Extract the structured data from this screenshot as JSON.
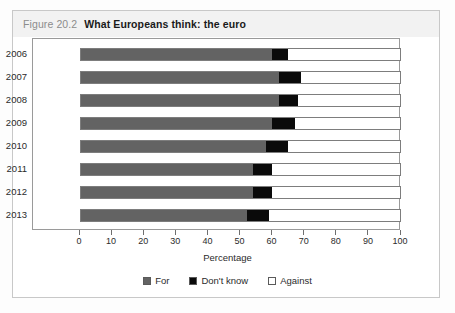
{
  "figure": {
    "number": "Figure 20.2",
    "title": "What Europeans think: the euro"
  },
  "legend": {
    "items": [
      {
        "label": "For",
        "color": "#636363",
        "swatch": "for-swatch"
      },
      {
        "label": "Don't know",
        "color": "#0a0a0a",
        "swatch": "dont-know-swatch"
      },
      {
        "label": "Against",
        "color": "#ffffff",
        "swatch": "against-swatch"
      }
    ]
  },
  "chart_data": {
    "type": "bar",
    "orientation": "horizontal",
    "stacked": true,
    "title": "What Europeans think: the euro",
    "xlabel": "Percentage",
    "ylabel": "",
    "xlim": [
      0,
      100
    ],
    "xticks": [
      0,
      10,
      20,
      30,
      40,
      50,
      60,
      70,
      80,
      90,
      100
    ],
    "grid": false,
    "legend_position": "bottom",
    "categories": [
      "2006",
      "2007",
      "2008",
      "2009",
      "2010",
      "2011",
      "2012",
      "2013"
    ],
    "series": [
      {
        "name": "For",
        "values": [
          60,
          62,
          62,
          60,
          58,
          54,
          54,
          52
        ]
      },
      {
        "name": "Don't know",
        "values": [
          5,
          7,
          6,
          7,
          7,
          6,
          6,
          7
        ]
      },
      {
        "name": "Against",
        "values": [
          35,
          31,
          32,
          33,
          35,
          40,
          40,
          41
        ]
      }
    ]
  }
}
